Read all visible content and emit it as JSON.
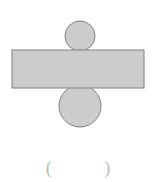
{
  "figure": {
    "background_color": "#ffffff",
    "fill_color": "#cccccc",
    "stroke_color": "#808080",
    "stroke_width": 1,
    "shapes": [
      {
        "name": "top-circle",
        "type": "circle",
        "cx": 80,
        "cy": 36,
        "r": 15
      },
      {
        "name": "horizontal-bar",
        "type": "rect",
        "x": 12,
        "y": 50,
        "width": 132,
        "height": 38
      },
      {
        "name": "bottom-circle",
        "type": "circle",
        "cx": 80,
        "cy": 106,
        "r": 21
      }
    ]
  },
  "answer": {
    "name": "answer-blank",
    "left_paren": "(",
    "right_paren": ")",
    "value": "",
    "text_color": "#bdbdbd"
  }
}
